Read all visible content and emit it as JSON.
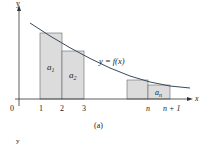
{
  "figure": {
    "caption": "(a)",
    "curve_label": "y = f(x)",
    "axes": {
      "x_label": "x",
      "y_label": "y",
      "origin_label": "0"
    },
    "x_ticks": [
      "1",
      "2",
      "3",
      "n",
      "n + 1"
    ],
    "bars": [
      {
        "label": "a",
        "sub": "1"
      },
      {
        "label": "a",
        "sub": "2"
      },
      {
        "label": "",
        "sub": ""
      },
      {
        "label": "a",
        "sub": "n"
      }
    ],
    "second_panel_y_label": "y",
    "colors": {
      "bar_fill": "#dcdcdc",
      "bar_stroke": "#555555",
      "curve": "#3a4a5a",
      "axis": "#333333"
    }
  }
}
